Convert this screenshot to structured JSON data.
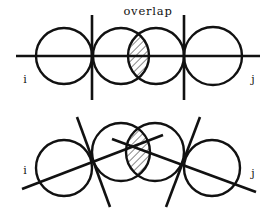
{
  "diagram": {
    "colors": {
      "stroke": "#111111",
      "background": "#ffffff"
    },
    "top": {
      "label_overlap": "overlap",
      "label_left": "i",
      "label_right": "j",
      "circles": [
        {
          "cx": 64,
          "cy": 56,
          "r": 28
        },
        {
          "cx": 121,
          "cy": 56,
          "r": 28
        },
        {
          "cx": 156,
          "cy": 56,
          "r": 28
        },
        {
          "cx": 213,
          "cy": 56,
          "r": 29
        }
      ],
      "axis_line": {
        "x1": 16,
        "y1": 56,
        "x2": 260,
        "y2": 56
      },
      "separator_lines": [
        {
          "x1": 92,
          "y1": 15,
          "x2": 92,
          "y2": 100
        },
        {
          "x1": 184,
          "y1": 15,
          "x2": 184,
          "y2": 100
        }
      ],
      "overlap_region": "hatched"
    },
    "bottom": {
      "label_left": "i",
      "label_right": "j",
      "circles": [
        {
          "cx": 64,
          "cy": 168,
          "r": 28
        },
        {
          "cx": 121,
          "cy": 152,
          "r": 29
        },
        {
          "cx": 155,
          "cy": 152,
          "r": 29
        },
        {
          "cx": 212,
          "cy": 168,
          "r": 28
        }
      ],
      "axis_lines": [
        {
          "x1": 22,
          "y1": 189,
          "x2": 163,
          "y2": 135
        },
        {
          "x1": 112,
          "y1": 139,
          "x2": 256,
          "y2": 192
        }
      ],
      "separator_lines": [
        {
          "x1": 77,
          "y1": 117,
          "x2": 110,
          "y2": 207
        },
        {
          "x1": 200,
          "y1": 117,
          "x2": 166,
          "y2": 207
        }
      ],
      "overlap_region": "hatched"
    }
  }
}
